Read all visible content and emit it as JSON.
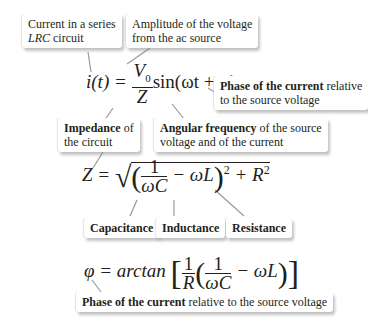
{
  "callouts": {
    "current": {
      "line1": "Current in a series",
      "line2_italic": "LRC",
      "line2_rest": " circuit"
    },
    "amplitude": {
      "line1": "Amplitude of the voltage",
      "line2": "from the ac source"
    },
    "phase_top": {
      "bold": "Phase of the current",
      "rest1": " relative",
      "line2": "to the source voltage"
    },
    "impedance": {
      "bold": "Impedance",
      "rest1": " of",
      "line2": "the circuit"
    },
    "angular": {
      "bold": "Angular frequency",
      "rest1": " of the source",
      "line2": "voltage and of the current"
    },
    "capacitance": {
      "bold": "Capacitance"
    },
    "inductance": {
      "bold": "Inductance"
    },
    "resistance": {
      "bold": "Resistance"
    },
    "phase_bottom": {
      "bold": "Phase of the current",
      "rest": " relative to the source voltage"
    }
  },
  "equations": {
    "current": {
      "lhs": "i(t) =",
      "num": "V",
      "num_sub": "0",
      "den": "Z",
      "rhs": "sin(ωt + φ)"
    },
    "impedance": {
      "lhs": "Z =",
      "one": "1",
      "den": "ωC",
      "minus": "− ωL",
      "power": "2",
      "plus": "+ R",
      "r_power": "2"
    },
    "phase": {
      "lhs": "φ = arctan",
      "one": "1",
      "r": "R",
      "one2": "1",
      "den": "ωC",
      "minus": "− ωL"
    }
  }
}
